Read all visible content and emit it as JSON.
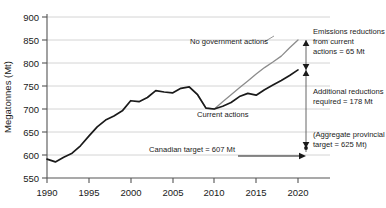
{
  "chart_data": {
    "type": "line",
    "title": "",
    "xlabel": "",
    "ylabel": "Megatonnes (Mt)",
    "xlim": [
      1990,
      2021.5
    ],
    "ylim": [
      550,
      900
    ],
    "xticks": [
      "1990",
      "1995",
      "2000",
      "2005",
      "2010",
      "2015",
      "2020"
    ],
    "xtick_values": [
      1990,
      1995,
      2000,
      2005,
      2010,
      2015,
      2020
    ],
    "yticks": [
      "550",
      "600",
      "650",
      "700",
      "750",
      "800",
      "850",
      "900"
    ],
    "ytick_values": [
      550,
      600,
      650,
      700,
      750,
      800,
      850,
      900
    ],
    "grid": true,
    "grid_axis": "y",
    "legend": "none",
    "series": [
      {
        "name": "No government actions",
        "color": "#8c8c8c",
        "x": [
          2007,
          2008,
          2009,
          2010,
          2011,
          2012,
          2013,
          2014,
          2015,
          2016,
          2017,
          2018,
          2019,
          2020
        ],
        "values": [
          748,
          731,
          702,
          700,
          716,
          731,
          746,
          761,
          776,
          790,
          802,
          815,
          833,
          850
        ]
      },
      {
        "name": "Current actions",
        "color": "#1a1a1a",
        "x": [
          1990,
          1991,
          1992,
          1993,
          1994,
          1995,
          1996,
          1997,
          1998,
          1999,
          2000,
          2001,
          2002,
          2003,
          2004,
          2005,
          2006,
          2007,
          2008,
          2009,
          2010,
          2011,
          2012,
          2013,
          2014,
          2015,
          2016,
          2017,
          2018,
          2019,
          2020
        ],
        "values": [
          591,
          585,
          595,
          604,
          620,
          641,
          661,
          676,
          685,
          696,
          718,
          716,
          725,
          740,
          737,
          735,
          745,
          748,
          731,
          702,
          700,
          706,
          714,
          727,
          734,
          730,
          742,
          752,
          762,
          773,
          785
        ]
      }
    ],
    "reference_lines": [
      {
        "name": "canadian-target",
        "value": 607,
        "label": "Canadian target = 607 Mt"
      },
      {
        "name": "aggregate-provincial-target",
        "value": 625,
        "label": "(Aggregate provincial target = 625 Mt)"
      }
    ],
    "annotations": [
      {
        "name": "no-government-actions-label",
        "text": "No government actions"
      },
      {
        "name": "current-actions-label",
        "text": "Current actions"
      },
      {
        "name": "emissions-reductions-note",
        "text": "Emissions reductions from current actions = 65 Mt",
        "line1": "Emissions reductions",
        "line2": "from current",
        "line3": "actions = 65 Mt",
        "value": 65
      },
      {
        "name": "additional-reductions-note",
        "text": "Additional reductions required = 178 Mt",
        "line1": "Additional reductions",
        "line2": "required = 178 Mt",
        "value": 178
      },
      {
        "name": "aggregate-provincial-note",
        "line1": "(Aggregate provincial",
        "line2": "target = 625 Mt)",
        "value": 625
      },
      {
        "name": "canadian-target-note",
        "text": "Canadian target = 607 Mt",
        "value": 607
      }
    ]
  },
  "axis": {
    "y_title": "Megatonnes (Mt)",
    "y_labels": [
      "900",
      "850",
      "800",
      "750",
      "700",
      "650",
      "600",
      "550"
    ],
    "x_labels": [
      "1990",
      "1995",
      "2000",
      "2005",
      "2010",
      "2015",
      "2020"
    ]
  },
  "labels": {
    "no_government_actions": "No government actions",
    "current_actions": "Current actions",
    "canadian_target": "Canadian target = 607 Mt",
    "emissions_reductions_l1": "Emissions reductions",
    "emissions_reductions_l2": "from current",
    "emissions_reductions_l3": "actions = 65 Mt",
    "additional_reductions_l1": "Additional reductions",
    "additional_reductions_l2": "required = 178 Mt",
    "aggregate_target_l1": "(Aggregate provincial",
    "aggregate_target_l2": "target = 625 Mt)"
  },
  "colors": {
    "no_government_actions": "#8c8c8c",
    "current_actions": "#1a1a1a",
    "grid": "#c8c8c8",
    "axis": "#555555",
    "background": "#ffffff"
  }
}
